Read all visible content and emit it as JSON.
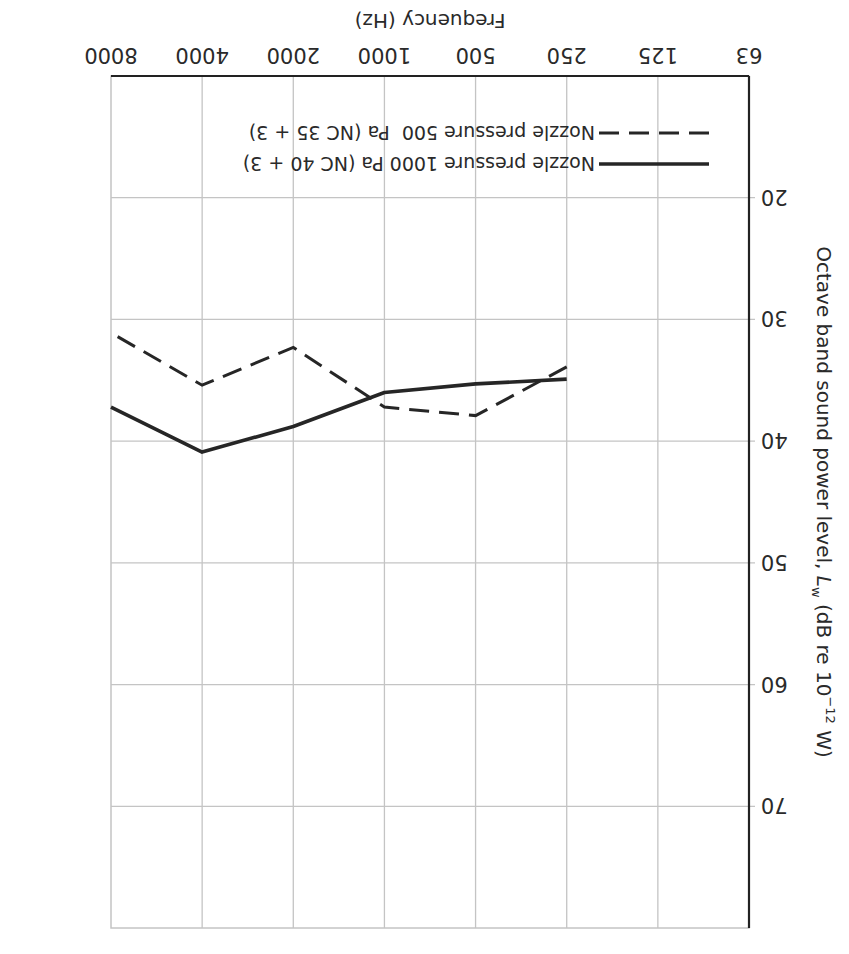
{
  "chart_data": {
    "type": "line",
    "orientation_note": "image rendered rotated 180 degrees",
    "title": "",
    "xlabel": "Frequency (Hz)",
    "ylabel": "Octave band sound power level, L_w (dB re 10^-12 W)",
    "ylabel_parts": {
      "main": "Octave band sound power level, ",
      "symbol": "L",
      "subscript": "w",
      "unit_pre": " (dB re 10",
      "exponent": "−12",
      "unit_post": " W)"
    },
    "x_categories": [
      "63",
      "125",
      "250",
      "500",
      "1000",
      "2000",
      "4000",
      "8000"
    ],
    "y_ticks": [
      "20",
      "30",
      "40",
      "50",
      "60",
      "70"
    ],
    "ylim": [
      10,
      80
    ],
    "grid": true,
    "legend_position": "inside, lower right (upright orientation)",
    "series": [
      {
        "name": "Nozzle pressure 1000 Pa (NC 40 + 3)",
        "style": "solid",
        "x": [
          "250",
          "500",
          "1000",
          "2000",
          "4000",
          "8000"
        ],
        "values": [
          34.9,
          35.3,
          36.0,
          38.8,
          40.9,
          37.2
        ]
      },
      {
        "name": "Nozzle pressure 500  Pa (NC 35 + 3)",
        "style": "dashed",
        "x": [
          "250",
          "500",
          "1000",
          "2000",
          "4000",
          "8000"
        ],
        "values": [
          33.9,
          37.9,
          37.2,
          32.3,
          35.4,
          31.1
        ]
      }
    ]
  },
  "axes": {
    "x_title": "Frequency (Hz)",
    "x_ticks": [
      "63",
      "125",
      "250",
      "500",
      "1000",
      "2000",
      "4000",
      "8000"
    ],
    "y_ticks": [
      "20",
      "30",
      "40",
      "50",
      "60",
      "70"
    ],
    "y_title_main": "Octave band sound power level, ",
    "y_title_symbol": "L",
    "y_title_sub": "w",
    "y_title_unit_pre": " (dB re 10",
    "y_title_exp": "−12",
    "y_title_unit_post": " W)"
  },
  "legend": {
    "items": [
      {
        "label": "Nozzle pressure 1000 Pa (NC 40 + 3)",
        "style": "solid"
      },
      {
        "label": "Nozzle pressure 500  Pa (NC 35 + 3)",
        "style": "dashed"
      }
    ]
  },
  "colors": {
    "line": "#262626",
    "grid": "#c4c4c4",
    "axis": "#222222",
    "background": "#ffffff"
  }
}
